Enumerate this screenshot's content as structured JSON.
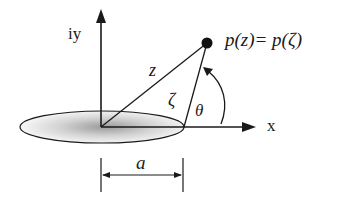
{
  "diagram": {
    "type": "geometry-schematic",
    "labels": {
      "y_axis": "iy",
      "x_axis": "x",
      "z_line": "z",
      "zeta_line": "ζ",
      "theta_angle": "θ",
      "point_equation": "p(z)= p(ζ)",
      "dimension": "a"
    },
    "colors": {
      "stroke": "#1a1a1a",
      "shading_center": "#9a9a9a",
      "background": "#ffffff"
    }
  }
}
